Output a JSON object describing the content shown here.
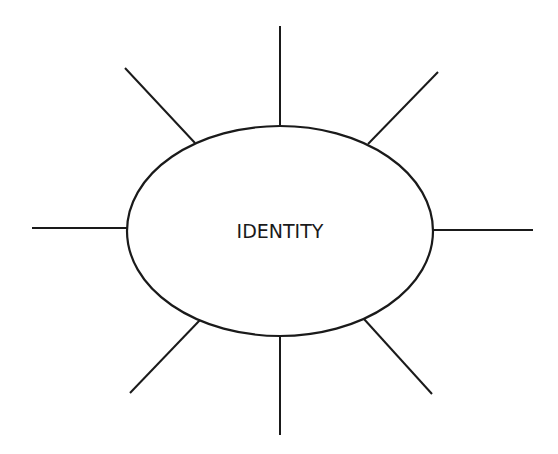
{
  "diagram": {
    "center_label": "IDENTITY",
    "stroke_color": "#1a1a1a",
    "background": "#ffffff",
    "ellipse": {
      "cx": 280,
      "cy": 231,
      "rx": 153,
      "ry": 105
    },
    "spokes": [
      {
        "name": "spoke-top",
        "x1": 280,
        "y1": 26,
        "x2": 280,
        "y2": 126
      },
      {
        "name": "spoke-top-right",
        "x1": 438,
        "y1": 72,
        "x2": 368,
        "y2": 144
      },
      {
        "name": "spoke-right",
        "x1": 433,
        "y1": 230,
        "x2": 533,
        "y2": 230
      },
      {
        "name": "spoke-bottom-right",
        "x1": 364,
        "y1": 319,
        "x2": 432,
        "y2": 394
      },
      {
        "name": "spoke-bottom",
        "x1": 280,
        "y1": 336,
        "x2": 280,
        "y2": 435
      },
      {
        "name": "spoke-bottom-left",
        "x1": 200,
        "y1": 320,
        "x2": 130,
        "y2": 393
      },
      {
        "name": "spoke-left",
        "x1": 32,
        "y1": 228,
        "x2": 127,
        "y2": 228
      },
      {
        "name": "spoke-top-left",
        "x1": 125,
        "y1": 68,
        "x2": 195,
        "y2": 143
      }
    ]
  }
}
